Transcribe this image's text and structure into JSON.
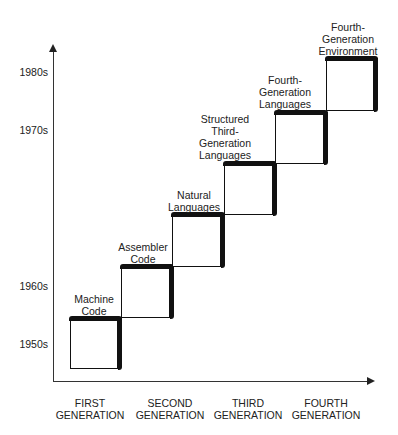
{
  "diagram": {
    "type": "staircase",
    "y_axis": {
      "labels": [
        "1950s",
        "1960s",
        "1970s",
        "1980s"
      ]
    },
    "x_axis": {
      "labels": [
        {
          "line1": "FIRST",
          "line2": "GENERATION"
        },
        {
          "line1": "SECOND",
          "line2": "GENERATION"
        },
        {
          "line1": "THIRD",
          "line2": "GENERATION"
        },
        {
          "line1": "FOURTH",
          "line2": "GENERATION"
        }
      ]
    },
    "steps": [
      {
        "lines": [
          "Machine",
          "Code"
        ]
      },
      {
        "lines": [
          "Assembler",
          "Code"
        ]
      },
      {
        "lines": [
          "Natural",
          "Languages"
        ]
      },
      {
        "lines": [
          "Structured",
          "Third-",
          "Generation",
          "Languages"
        ]
      },
      {
        "lines": [
          "Fourth-",
          "Generation",
          "Languages"
        ]
      },
      {
        "lines": [
          "Fourth-",
          "Generation",
          "Environment"
        ]
      }
    ]
  }
}
